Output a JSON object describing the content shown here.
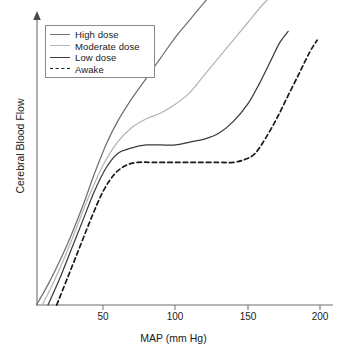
{
  "chart_data": {
    "type": "line",
    "title": "",
    "xlabel": "MAP (mm Hg)",
    "ylabel": "Cerebral Blood Flow",
    "xlim": [
      0,
      205
    ],
    "ylim": [
      0,
      100
    ],
    "xticks": [
      50,
      100,
      150,
      200
    ],
    "xtick_labels": [
      "50",
      "100",
      "150",
      "200"
    ],
    "yticks": [],
    "ytick_labels": [],
    "grid": false,
    "legend_position": "upper-left",
    "series": [
      {
        "name": "High dose",
        "color": "#707070",
        "style": "solid",
        "x": [
          4,
          12,
          20,
          28,
          36,
          44,
          52,
          60,
          70,
          80,
          90,
          100,
          110,
          120,
          125
        ],
        "y": [
          0,
          7,
          15,
          24,
          34,
          45,
          55,
          63,
          71,
          78,
          85,
          92,
          98,
          104,
          107
        ]
      },
      {
        "name": "Moderate dose",
        "color": "#b4b4b4",
        "style": "solid",
        "x": [
          8,
          16,
          24,
          32,
          40,
          50,
          60,
          70,
          80,
          90,
          100,
          110,
          120,
          130,
          140,
          150,
          160,
          168
        ],
        "y": [
          0,
          8,
          17,
          27,
          37,
          48,
          56,
          61,
          64,
          66,
          69,
          73,
          79,
          85,
          91,
          97,
          103,
          107
        ]
      },
      {
        "name": "Low dose",
        "color": "#3a3a3a",
        "style": "solid",
        "x": [
          12,
          20,
          28,
          36,
          44,
          52,
          60,
          70,
          80,
          90,
          100,
          110,
          120,
          130,
          140,
          150,
          158,
          166,
          172,
          178
        ],
        "y": [
          0,
          9,
          19,
          29,
          39,
          47,
          52,
          54,
          55,
          55,
          55,
          56,
          57,
          59,
          63,
          69,
          76,
          84,
          90,
          94
        ]
      },
      {
        "name": "Awake",
        "color": "#1a1a1a",
        "style": "dashed",
        "x": [
          18,
          26,
          34,
          42,
          50,
          58,
          66,
          74,
          85,
          100,
          115,
          130,
          140,
          148,
          155,
          162,
          170,
          178,
          186,
          193,
          198
        ],
        "y": [
          0,
          10,
          20,
          30,
          39,
          45,
          48,
          49,
          49,
          49,
          49,
          49,
          49,
          50,
          52,
          57,
          64,
          72,
          80,
          87,
          91
        ]
      }
    ]
  },
  "legend": {
    "entries": [
      {
        "label": "High dose"
      },
      {
        "label": "Moderate dose"
      },
      {
        "label": "Low dose"
      },
      {
        "label": "Awake"
      }
    ]
  },
  "axes": {
    "x_title": "MAP (mm Hg)",
    "y_title": "Cerebral Blood Flow",
    "x_tick_labels": [
      "50",
      "100",
      "150",
      "200"
    ]
  }
}
